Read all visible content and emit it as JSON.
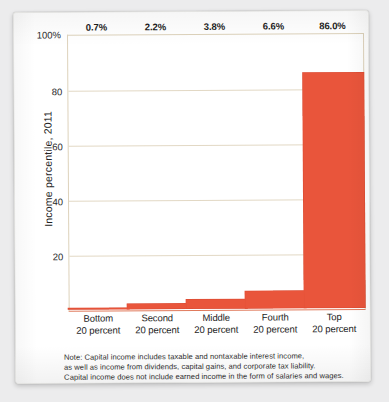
{
  "chart_data": {
    "type": "bar",
    "title": "",
    "subtitle": "",
    "xlabel": "",
    "ylabel": "Income percentile, 2011",
    "categories": [
      "Bottom 20 percent",
      "Second 20 percent",
      "Middle 20 percent",
      "Fourth 20 percent",
      "Top 20 percent"
    ],
    "category_lines": [
      [
        "Bottom",
        "20 percent"
      ],
      [
        "Second",
        "20 percent"
      ],
      [
        "Middle",
        "20 percent"
      ],
      [
        "Fourth",
        "20 percent"
      ],
      [
        "Top",
        "20 percent"
      ]
    ],
    "values": [
      0.7,
      2.2,
      3.8,
      6.6,
      86.0
    ],
    "value_labels": [
      "0.7%",
      "2.2%",
      "3.8%",
      "6.6%",
      "86.0%"
    ],
    "ylim": [
      0,
      100
    ],
    "yticks": [
      20,
      40,
      60,
      80,
      100
    ],
    "ytick_labels": [
      "20",
      "40",
      "60",
      "80",
      "100%"
    ],
    "grid": true,
    "legend": "none",
    "bar_color": "#e9553b",
    "gridline_color": "#e2d8c4",
    "axis_color": "#ddd2bb",
    "baseline_color": "#e07a5c"
  },
  "note": {
    "lines": [
      "Note: Capital income includes taxable and nontaxable interest income,",
      "as well as income from dividends, capital gains, and corporate tax liability.",
      "Capital income does not include earned income in the form of salaries and wages."
    ]
  }
}
